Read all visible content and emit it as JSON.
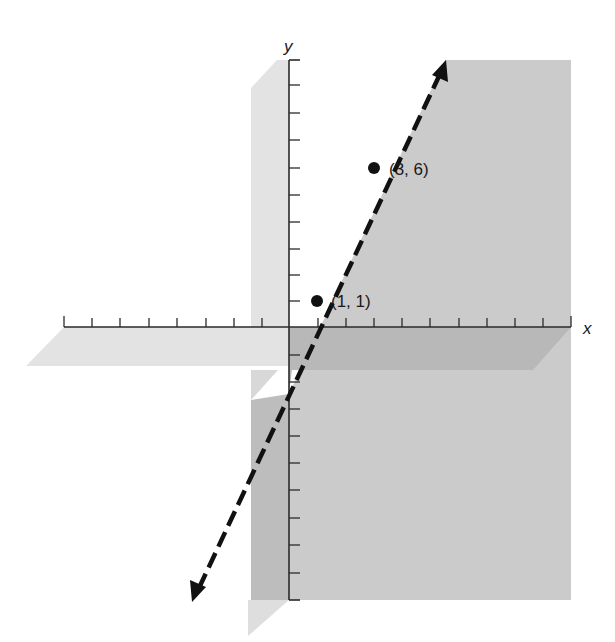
{
  "figure": {
    "type": "coordinate-plane-graph",
    "axes": {
      "x_label": "x",
      "y_label": "y",
      "x_ticks_left_of_origin": 8,
      "x_ticks_right_of_origin": 10,
      "y_ticks_above_origin": 10,
      "y_ticks_below_origin": 10
    },
    "points": [
      {
        "label": "(1, 1)",
        "x": 1,
        "y": 1
      },
      {
        "label": "(3, 6)",
        "x": 3,
        "y": 6
      }
    ],
    "line": {
      "style": "dashed",
      "arrows": "both-ends",
      "equation_implied": "y = 5x - 4",
      "slope": 5,
      "y_intercept": -4
    },
    "shading": {
      "region_right_of_line": "#c8c8c8",
      "light_strip": "#e2e2e2",
      "dark_band": "#b4b4b4"
    },
    "colors": {
      "axis": "#2a2a2a",
      "line": "#111111",
      "background": "#ffffff"
    }
  }
}
